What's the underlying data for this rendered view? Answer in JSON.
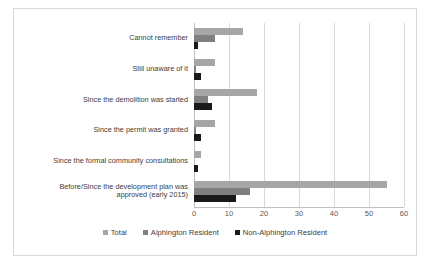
{
  "chart_data": {
    "type": "bar",
    "orientation": "horizontal",
    "title": "",
    "xlabel": "",
    "ylabel": "",
    "xlim": [
      0,
      60
    ],
    "xticks": [
      0,
      10,
      20,
      30,
      40,
      50,
      60
    ],
    "xtick_labels": [
      "0",
      "10",
      "20",
      "30",
      "40",
      "50",
      "60"
    ],
    "grid": true,
    "legend_position": "bottom",
    "categories": [
      "Cannot remember",
      "Still unaware of it",
      "Since the demolition was started",
      "Since the permit was granted",
      "Since the formal community consultations",
      "Before/Since the development plan was\napproved (early 2015)"
    ],
    "series": [
      {
        "name": "Total",
        "color": "#a6a6a6",
        "values": [
          14,
          6,
          18,
          6,
          2,
          55
        ]
      },
      {
        "name": "Alphington Resident",
        "color": "#808080",
        "values": [
          6,
          0.5,
          4,
          0.5,
          0,
          16
        ]
      },
      {
        "name": "Non-Alphington Resident",
        "color": "#1a1a1a",
        "values": [
          1,
          2,
          5,
          2,
          1,
          12
        ]
      }
    ]
  },
  "legend": {
    "items": [
      {
        "label": "Total",
        "swatch": "total"
      },
      {
        "label": "Alphington Resident",
        "swatch": "alph"
      },
      {
        "label": "Non-Alphington Resident",
        "swatch": "nonalph"
      }
    ]
  }
}
